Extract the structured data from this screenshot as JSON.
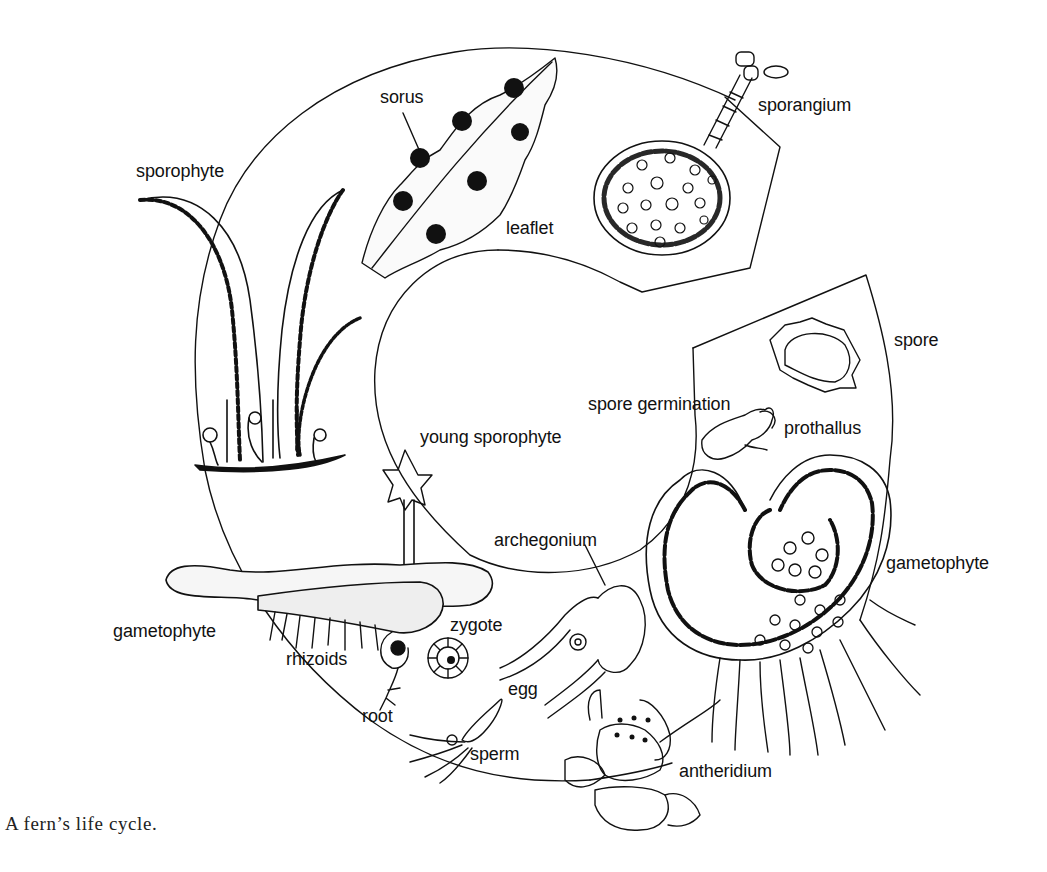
{
  "figure": {
    "caption": "A fern’s life cycle.",
    "colors": {
      "ink": "#111111",
      "background": "#ffffff"
    }
  },
  "labels": {
    "sporophyte": "sporophyte",
    "sorus": "sorus",
    "leaflet": "leaflet",
    "sporangium": "sporangium",
    "spore": "spore",
    "spore_germination": "spore germination",
    "prothallus": "prothallus",
    "young_sporophyte": "young sporophyte",
    "archegonium": "archegonium",
    "gametophyte_right": "gametophyte",
    "gametophyte_left": "gametophyte",
    "zygote": "zygote",
    "rhizoids": "rhizoids",
    "egg": "egg",
    "root": "root",
    "sperm": "sperm",
    "antheridium": "antheridium"
  },
  "stages": [
    "sporophyte",
    "leaflet",
    "sorus",
    "sporangium",
    "spore",
    "spore germination",
    "prothallus",
    "gametophyte",
    "archegonium",
    "egg",
    "antheridium",
    "sperm",
    "zygote",
    "young sporophyte",
    "rhizoids",
    "root"
  ]
}
